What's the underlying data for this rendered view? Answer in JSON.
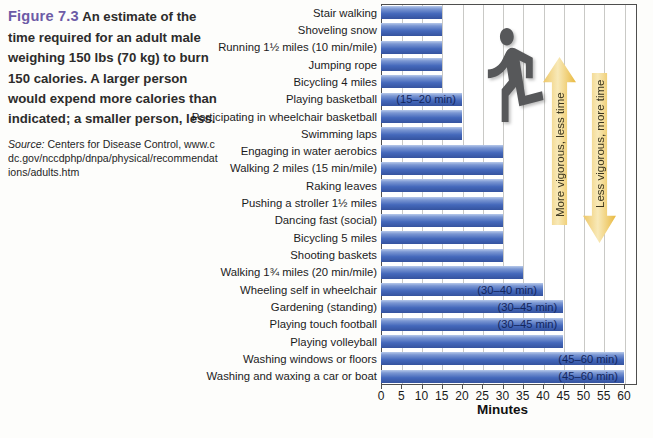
{
  "figure": {
    "label": "Figure 7.3",
    "caption": "An estimate of the time required for an adult male weighing 150 lbs (70 kg) to burn 150 calories. A larger person would expend more calories than indicated; a smaller person, less.",
    "source_label": "Source:",
    "source_text": "Centers for Disease Control,",
    "source_url": "www.cdc.gov/nccdphp/dnpa/physical/recommendations/adults.htm"
  },
  "chart_data": {
    "type": "bar",
    "orientation": "horizontal",
    "title": "",
    "xlabel": "Minutes",
    "x_ticks": [
      0,
      5,
      10,
      15,
      20,
      25,
      30,
      35,
      40,
      45,
      50,
      55,
      60
    ],
    "xlim": [
      0,
      63
    ],
    "grid": "vertical gridlines every 5 minutes",
    "categories": [
      "Stair walking",
      "Shoveling snow",
      "Running 1½ miles (10 min/mile)",
      "Jumping rope",
      "Bicycling 4 miles",
      "Playing basketball",
      "Participating in wheelchair basketball",
      "Swimming laps",
      "Engaging in water aerobics",
      "Walking 2 miles (15 min/mile)",
      "Raking leaves",
      "Pushing a stroller 1½ miles",
      "Dancing fast (social)",
      "Bicycling 5 miles",
      "Shooting baskets",
      "Walking 1¾ miles (20 min/mile)",
      "Wheeling self in wheelchair",
      "Gardening (standing)",
      "Playing touch football",
      "Playing volleyball",
      "Washing windows or floors",
      "Washing and waxing a car or boat"
    ],
    "values": [
      15,
      15,
      15,
      15,
      15,
      20,
      20,
      20,
      30,
      30,
      30,
      30,
      30,
      30,
      30,
      35,
      40,
      45,
      45,
      45,
      60,
      60
    ],
    "bar_labels": [
      "",
      "",
      "",
      "",
      "",
      "(15–20 min)",
      "",
      "",
      "",
      "",
      "",
      "",
      "",
      "",
      "",
      "",
      "(30–40 min)",
      "(30–45 min)",
      "(30–45 min)",
      "",
      "(45–60 min)",
      "(45–60 min)"
    ],
    "bar_color_top": "#b7c9ea",
    "bar_color_bottom": "#35539f"
  },
  "annotations": {
    "up_arrow": "More vigorous, less time",
    "down_arrow": "Less vigorous, more time",
    "arrow_color": "#eec155",
    "runner_icon": "running-person-silhouette"
  }
}
